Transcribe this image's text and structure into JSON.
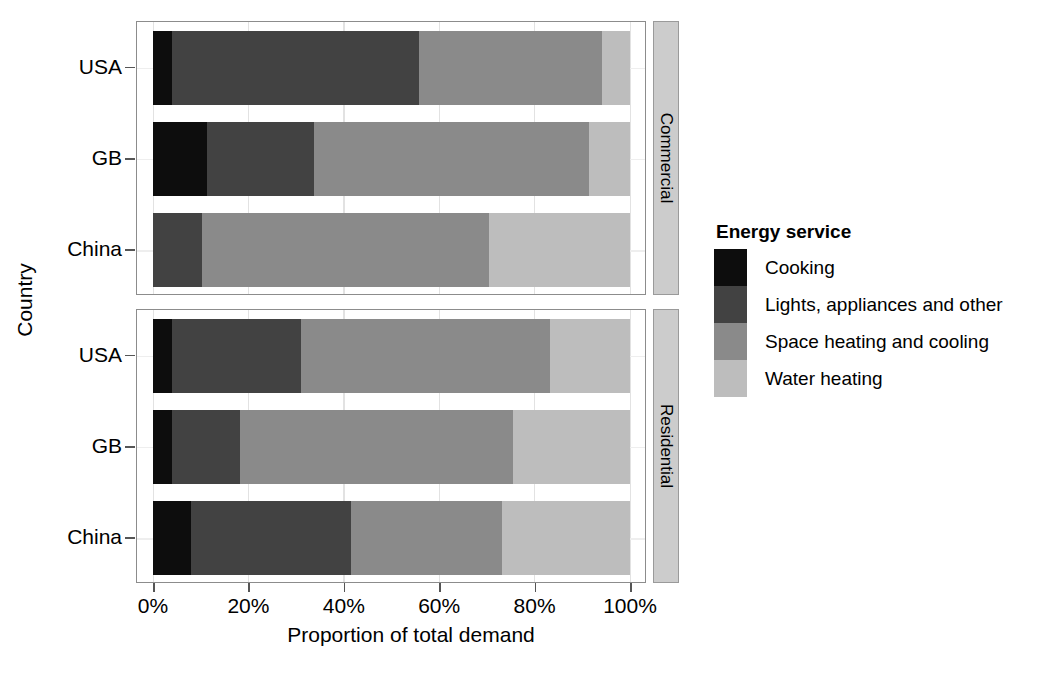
{
  "chart_data": {
    "type": "bar",
    "orientation": "horizontal",
    "stacked": true,
    "normalized": true,
    "title": "",
    "xlabel": "Proportion of total demand",
    "ylabel": "Country",
    "xlim": [
      0,
      100
    ],
    "xticks": [
      0,
      20,
      40,
      60,
      80,
      100
    ],
    "xtick_labels": [
      "0%",
      "20%",
      "40%",
      "60%",
      "80%",
      "100%"
    ],
    "categories": [
      "USA",
      "GB",
      "China"
    ],
    "grid": true,
    "legend": {
      "title": "Energy service",
      "position": "right",
      "entries": [
        {
          "label": "Cooking",
          "color": "#0d0d0d"
        },
        {
          "label": "Lights, appliances and other",
          "color": "#424242"
        },
        {
          "label": "Space heating and cooling",
          "color": "#8a8a8a"
        },
        {
          "label": "Water heating",
          "color": "#bdbdbd"
        }
      ]
    },
    "facets": [
      {
        "name": "Commercial",
        "rows": [
          {
            "category": "USA",
            "values": [
              4.0,
              51.8,
              38.4,
              5.8
            ]
          },
          {
            "category": "GB",
            "values": [
              11.5,
              22.3,
              57.6,
              8.6
            ]
          },
          {
            "category": "China",
            "values": [
              0.0,
              10.3,
              60.3,
              29.4
            ]
          }
        ]
      },
      {
        "name": "Residential",
        "rows": [
          {
            "category": "USA",
            "values": [
              4.0,
              27.2,
              52.2,
              16.6
            ]
          },
          {
            "category": "GB",
            "values": [
              4.0,
              14.4,
              57.1,
              24.5
            ]
          },
          {
            "category": "China",
            "values": [
              8.0,
              33.5,
              31.7,
              26.8
            ]
          }
        ]
      }
    ],
    "series_names": [
      "Cooking",
      "Lights, appliances and other",
      "Space heating and cooling",
      "Water heating"
    ]
  }
}
